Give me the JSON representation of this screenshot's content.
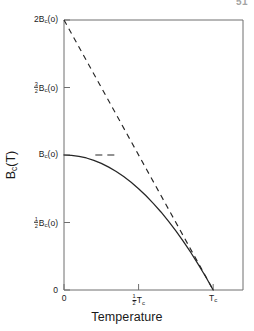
{
  "page": {
    "page_number": "51"
  },
  "figure": {
    "name": "critical-field-temperature-plot"
  },
  "chart_data": {
    "type": "line",
    "title": "",
    "subtitle": "",
    "xlabel": "Temperature",
    "ylabel": "B",
    "ylabel_sub": "c",
    "ylabel_tail": "(T)",
    "ylabel_full": "Bc(T)",
    "grid": false,
    "legend": "none",
    "xlim": [
      0,
      1.2
    ],
    "ylim": [
      0,
      2
    ],
    "x_units": "T_c",
    "y_units": "B_c(0)",
    "xticks": [
      {
        "value": 0,
        "label": "0",
        "frac_num": "",
        "frac_den": "",
        "base": "0",
        "sub": ""
      },
      {
        "value": 0.5,
        "label": "1/2 Tc",
        "frac_num": "1",
        "frac_den": "2",
        "base": "T",
        "sub": "c"
      },
      {
        "value": 1.0,
        "label": "Tc",
        "frac_num": "",
        "frac_den": "",
        "base": "T",
        "sub": "c"
      }
    ],
    "yticks": [
      {
        "value": 2.0,
        "label": "2Bc(o)",
        "prefix": "2",
        "frac_num": "",
        "frac_den": "",
        "base": "B",
        "sub": "c",
        "tail": "(o)"
      },
      {
        "value": 1.5,
        "label": "3/2 Bc(o)",
        "prefix": "",
        "frac_num": "3",
        "frac_den": "2",
        "base": "B",
        "sub": "c",
        "tail": "(o)"
      },
      {
        "value": 1.0,
        "label": "Bc(o)",
        "prefix": "",
        "frac_num": "",
        "frac_den": "",
        "base": "B",
        "sub": "c",
        "tail": "(o)"
      },
      {
        "value": 0.5,
        "label": "1/2 Bc(o)",
        "prefix": "",
        "frac_num": "1",
        "frac_den": "2",
        "base": "B",
        "sub": "c",
        "tail": "(o)"
      },
      {
        "value": 0.0,
        "label": "0",
        "prefix": "0",
        "frac_num": "",
        "frac_den": "",
        "base": "",
        "sub": "",
        "tail": ""
      }
    ],
    "series": [
      {
        "name": "linear-extrapolation",
        "style": "dashed",
        "color": "#262626",
        "x": [
          0.0,
          1.0
        ],
        "y": [
          2.0,
          0.0
        ]
      },
      {
        "name": "critical-field-curve",
        "style": "solid",
        "color": "#262626",
        "x": [
          0.0,
          0.05,
          0.1,
          0.15,
          0.2,
          0.25,
          0.3,
          0.35,
          0.4,
          0.45,
          0.5,
          0.55,
          0.6,
          0.65,
          0.7,
          0.75,
          0.8,
          0.85,
          0.9,
          0.95,
          1.0
        ],
        "y": [
          1.0,
          0.998,
          0.99,
          0.978,
          0.96,
          0.938,
          0.91,
          0.878,
          0.84,
          0.798,
          0.75,
          0.698,
          0.64,
          0.578,
          0.51,
          0.438,
          0.36,
          0.278,
          0.19,
          0.098,
          0.0
        ]
      },
      {
        "name": "zero-slope-marker",
        "style": "dashed-short",
        "color": "#262626",
        "x": [
          0.21,
          0.37
        ],
        "y": [
          1.0,
          1.0
        ]
      }
    ]
  }
}
